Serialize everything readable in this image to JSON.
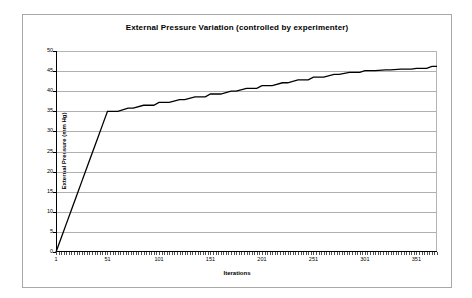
{
  "chart_data": {
    "type": "line",
    "title": "External Pressure Variation (controlled by experimenter)",
    "xlabel": "Iterations",
    "ylabel": "External Pressure (mm Hg)",
    "xlim": [
      1,
      371
    ],
    "ylim": [
      0,
      50
    ],
    "xticks": [
      1,
      51,
      101,
      151,
      201,
      251,
      301,
      351
    ],
    "yticks": [
      0,
      5,
      10,
      15,
      20,
      25,
      30,
      35,
      40,
      45,
      50
    ],
    "grid": true,
    "legend": false,
    "series": [
      {
        "name": "External Pressure",
        "color": "#000000",
        "x": [
          1,
          6,
          11,
          16,
          21,
          26,
          31,
          36,
          41,
          46,
          51,
          61,
          71,
          76,
          86,
          96,
          101,
          111,
          121,
          126,
          136,
          146,
          151,
          161,
          171,
          176,
          186,
          196,
          201,
          211,
          221,
          226,
          236,
          246,
          251,
          261,
          271,
          276,
          286,
          296,
          301,
          311,
          321,
          326,
          336,
          346,
          351,
          361,
          366,
          371
        ],
        "y": [
          0,
          3.5,
          7,
          10.5,
          14,
          17.5,
          21,
          24.5,
          28,
          31.5,
          35,
          35,
          35.8,
          35.8,
          36.5,
          36.5,
          37.2,
          37.2,
          37.9,
          37.9,
          38.6,
          38.6,
          39.3,
          39.3,
          40,
          40,
          40.7,
          40.7,
          41.4,
          41.4,
          42.1,
          42.1,
          42.8,
          42.8,
          43.5,
          43.5,
          44.2,
          44.2,
          44.7,
          44.7,
          45.1,
          45.1,
          45.3,
          45.3,
          45.5,
          45.5,
          45.7,
          45.7,
          46.2,
          46.2
        ]
      }
    ]
  }
}
